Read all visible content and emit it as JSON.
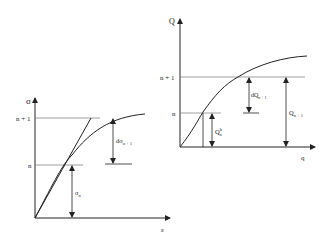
{
  "left_diagram": {
    "y_axis_label": "σ",
    "x_axis_label": "ε",
    "levels": {
      "upper": "n + 1",
      "lower": "n"
    },
    "increment_label": {
      "main": "dσ",
      "sub": "n + 1"
    },
    "base_label": {
      "main": "σ",
      "sub": "n"
    }
  },
  "right_diagram": {
    "y_axis_label": "Q",
    "x_axis_label": "q",
    "levels": {
      "upper": "n + 1",
      "lower": "n"
    },
    "increment_label": {
      "main": "dQ",
      "sub": "n + 1"
    },
    "base_label": {
      "main": "Q",
      "sub": "n",
      "sup": "b"
    },
    "total_label": {
      "main": "Q",
      "sub": "n + 1"
    }
  }
}
